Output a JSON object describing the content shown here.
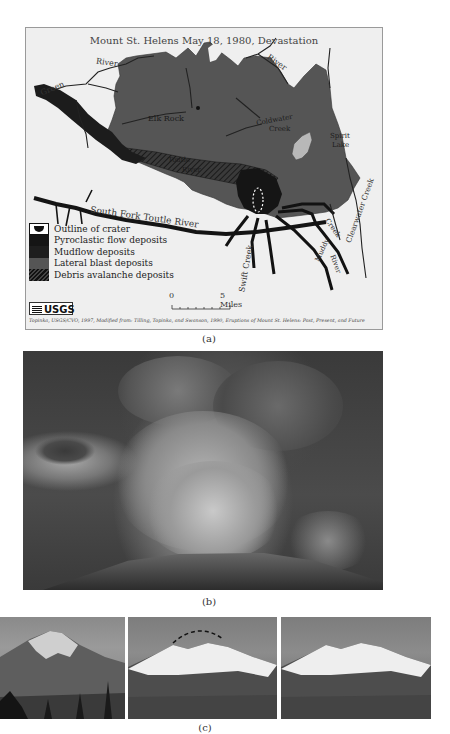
{
  "figure": {
    "panels": [
      "(a)",
      "(b)",
      "(c)"
    ]
  },
  "map": {
    "title": "Mount St. Helens May 18, 1980, Devastation",
    "labels": {
      "green": "Green",
      "river_nw": "River",
      "river_ne": "River",
      "elk_rock": "Elk Rock",
      "coldwater_1": "Coldwater",
      "coldwater_2": "Creek",
      "spirit_1": "Spirit",
      "spirit_2": "Lake",
      "north_fork": "North",
      "fork": "Fork",
      "toutle": "Toutle",
      "river_tr": "River",
      "south_fork": "South Fork Toutle River",
      "swift_creek": "Swift Creek",
      "muddy": "Muddy",
      "river_mr": "River",
      "creek_smith": "Creek",
      "clearwater": "Clearwater Creek"
    },
    "legend": [
      {
        "label": "Outline of crater",
        "symbol": "crater-outline",
        "color": "#ffffff"
      },
      {
        "label": "Pyroclastic flow deposits",
        "symbol": "solid",
        "color": "#151515"
      },
      {
        "label": "Mudflow deposits",
        "symbol": "solid",
        "color": "#1e1e1e"
      },
      {
        "label": "Lateral blast deposits",
        "symbol": "solid",
        "color": "#555555"
      },
      {
        "label": "Debris avalanche deposits",
        "symbol": "hatched",
        "color": "#2a2a2a"
      }
    ],
    "scale": {
      "start": "0",
      "end": "5 Miles"
    },
    "logo": "USGS",
    "citation": "Topinka, USGS/CVO, 1997, Modified from: Tilling, Topinka, and Swanson, 1990, Eruptions of Mount St. Helens: Past, Present, and Future",
    "colors": {
      "background": "#efefef",
      "blast_zone": "#555555",
      "deposits": "#151515",
      "lake": "#b5b5b5",
      "rivers": "#1a1a1a"
    }
  },
  "captions": {
    "a": "(a)",
    "b": "(b)",
    "c": "(c)"
  },
  "photos": {
    "b": {
      "subject": "eruption column ash plume"
    },
    "c": [
      {
        "subject": "mountain before eruption"
      },
      {
        "subject": "mountain after eruption with dashed former summit outline"
      },
      {
        "subject": "mountain after eruption"
      }
    ]
  }
}
